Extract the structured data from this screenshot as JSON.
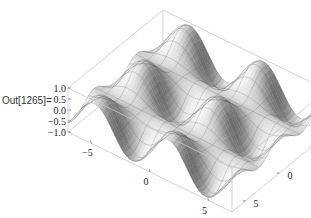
{
  "cell": {
    "out_label": "Out[1265]="
  },
  "chart_data": {
    "type": "surface3d",
    "title": "",
    "function": "Sin[x] Cos[y]-like periodic surface",
    "x_range": [
      -7,
      7
    ],
    "y_range": [
      -7,
      7
    ],
    "z_range": [
      -1.0,
      1.0
    ],
    "z_ticks": [
      "1.0",
      "0.5",
      "0.0",
      "−0.5",
      "−1.0"
    ],
    "x_ticks": [
      "−5",
      "0",
      "5"
    ],
    "y_ticks": [
      "−5",
      "0",
      "5"
    ],
    "xlabel": "",
    "ylabel": "",
    "zlabel": "",
    "mesh": true,
    "box": true,
    "colors": {
      "box_line": "#c8c8c8",
      "mesh_line": "#333333",
      "surface_light": "#f2f2f2",
      "surface_dark": "#3a3a3a"
    }
  }
}
